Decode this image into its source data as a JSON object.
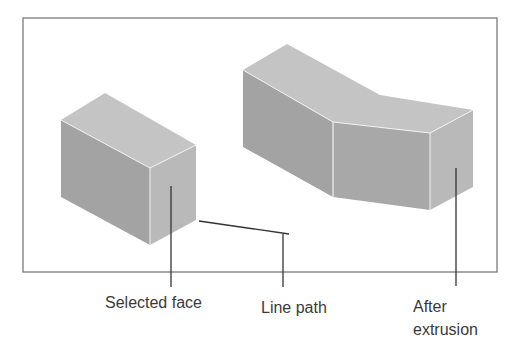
{
  "diagram": {
    "title": "",
    "labels": {
      "selected_face": "Selected face",
      "line_path": "Line path",
      "after_extrusion_line1": "After",
      "after_extrusion_line2": "extrusion"
    },
    "colors": {
      "frame": "#7a7a7a",
      "top_face": "#c4c4c4",
      "left_face": "#a3a3a3",
      "right_face": "#b9b9b9",
      "edge_highlight": "#f2f2f2",
      "leader": "#333333",
      "text": "#3a3a3a"
    }
  }
}
